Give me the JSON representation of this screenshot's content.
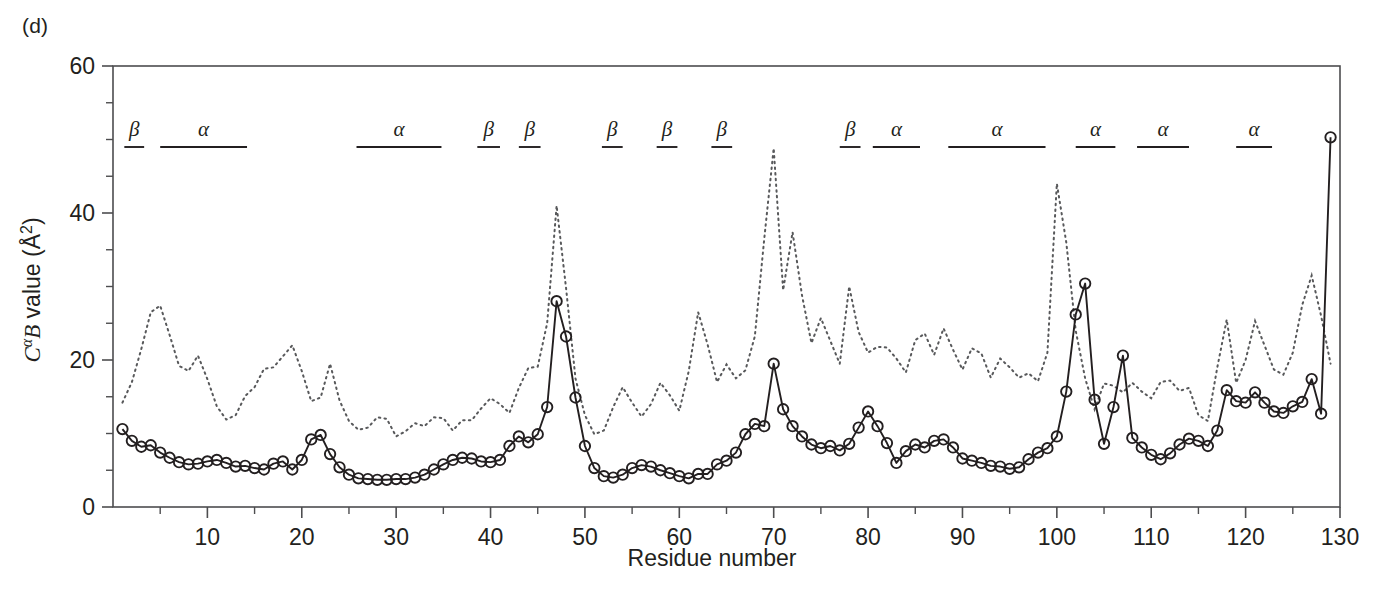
{
  "panel": {
    "label": "(d)"
  },
  "axes": {
    "y_title_parts": {
      "c": "C",
      "alpha": "α",
      "b": "B",
      "rest": " value (Å",
      "sup": "2",
      "close": ")"
    },
    "y_title_plain": "CαB value (Å2)",
    "x_title": "Residue number",
    "y_ticks_major": [
      0,
      20,
      40,
      60
    ],
    "y_ticks_minor": [
      5,
      10,
      15,
      25,
      30,
      35,
      45,
      50,
      55
    ],
    "x_ticks_major": [
      10,
      20,
      30,
      40,
      50,
      60,
      70,
      80,
      90,
      100,
      110,
      120,
      130
    ],
    "x_ticks_minor": [
      5,
      15,
      25,
      35,
      45,
      55,
      65,
      75,
      85,
      95,
      105,
      115,
      125
    ],
    "xlim": [
      0,
      130
    ],
    "ylim": [
      0,
      60
    ],
    "grid": false
  },
  "colors": {
    "axis": "#4d4d4f",
    "solid_series": "#231f20",
    "dotted_series": "#58595b",
    "text": "#231f20",
    "background": "#ffffff"
  },
  "secondary_structure": {
    "row_label": "secondary structure annotation",
    "elements": [
      {
        "type": "β",
        "start": 1.2,
        "end": 3.3
      },
      {
        "type": "α",
        "start": 5.0,
        "end": 14.2
      },
      {
        "type": "α",
        "start": 25.8,
        "end": 34.8
      },
      {
        "type": "β",
        "start": 38.6,
        "end": 41.0
      },
      {
        "type": "β",
        "start": 43.0,
        "end": 45.3
      },
      {
        "type": "β",
        "start": 51.8,
        "end": 54.0
      },
      {
        "type": "β",
        "start": 57.6,
        "end": 59.8
      },
      {
        "type": "β",
        "start": 63.4,
        "end": 65.6
      },
      {
        "type": "β",
        "start": 77.0,
        "end": 79.2
      },
      {
        "type": "α",
        "start": 80.5,
        "end": 85.5
      },
      {
        "type": "α",
        "start": 88.5,
        "end": 98.8
      },
      {
        "type": "α",
        "start": 102.0,
        "end": 106.2
      },
      {
        "type": "α",
        "start": 108.5,
        "end": 114.0
      },
      {
        "type": "α",
        "start": 119.0,
        "end": 122.8
      }
    ]
  },
  "chart_data": {
    "type": "line",
    "title": "",
    "xlabel": "Residue number",
    "ylabel": "CαB value (Å2)",
    "xlim": [
      0,
      130
    ],
    "ylim": [
      0,
      60
    ],
    "grid": false,
    "legend": "none",
    "x": [
      1,
      2,
      3,
      4,
      5,
      6,
      7,
      8,
      9,
      10,
      11,
      12,
      13,
      14,
      15,
      16,
      17,
      18,
      19,
      20,
      21,
      22,
      23,
      24,
      25,
      26,
      27,
      28,
      29,
      30,
      31,
      32,
      33,
      34,
      35,
      36,
      37,
      38,
      39,
      40,
      41,
      42,
      43,
      44,
      45,
      46,
      47,
      48,
      49,
      50,
      51,
      52,
      53,
      54,
      55,
      56,
      57,
      58,
      59,
      60,
      61,
      62,
      63,
      64,
      65,
      66,
      67,
      68,
      69,
      70,
      71,
      72,
      73,
      74,
      75,
      76,
      77,
      78,
      79,
      80,
      81,
      82,
      83,
      84,
      85,
      86,
      87,
      88,
      89,
      90,
      91,
      92,
      93,
      94,
      95,
      96,
      97,
      98,
      99,
      100,
      101,
      102,
      103,
      104,
      105,
      106,
      107,
      108,
      109,
      110,
      111,
      112,
      113,
      114,
      115,
      116,
      117,
      118,
      119,
      120,
      121,
      122,
      123,
      124,
      125,
      126,
      127,
      128,
      129
    ],
    "series": [
      {
        "name": "observed C-alpha B factors",
        "style": "solid-with-open-circle-markers",
        "values": [
          10.6,
          9.0,
          8.2,
          8.4,
          7.4,
          6.7,
          6.1,
          5.8,
          5.9,
          6.2,
          6.4,
          6.0,
          5.5,
          5.6,
          5.3,
          5.1,
          5.9,
          6.2,
          5.1,
          6.4,
          9.2,
          9.8,
          7.2,
          5.4,
          4.4,
          3.9,
          3.8,
          3.7,
          3.7,
          3.8,
          3.8,
          4.0,
          4.4,
          5.1,
          5.8,
          6.4,
          6.7,
          6.6,
          6.2,
          6.1,
          6.4,
          8.3,
          9.6,
          8.8,
          9.9,
          13.6,
          28.0,
          23.2,
          14.9,
          8.3,
          5.3,
          4.2,
          4.0,
          4.4,
          5.3,
          5.7,
          5.5,
          5.0,
          4.6,
          4.2,
          3.9,
          4.5,
          4.5,
          5.8,
          6.3,
          7.4,
          9.9,
          11.3,
          11.0,
          19.5,
          13.3,
          11.0,
          9.6,
          8.5,
          8.0,
          8.3,
          7.7,
          8.6,
          10.8,
          13.0,
          11.0,
          8.7,
          6.0,
          7.6,
          8.5,
          8.1,
          9.0,
          9.2,
          8.1,
          6.6,
          6.3,
          6.0,
          5.6,
          5.5,
          5.2,
          5.4,
          6.5,
          7.4,
          8.0,
          9.6,
          15.7,
          26.2,
          30.4,
          14.6,
          8.6,
          13.6,
          20.6,
          9.4,
          8.1,
          7.1,
          6.5,
          7.3,
          8.5,
          9.3,
          9.0,
          8.3,
          10.4,
          15.9,
          14.4,
          14.2,
          15.6,
          14.2,
          13.0,
          12.8,
          13.7,
          14.3,
          17.4,
          12.7,
          50.3
        ]
      },
      {
        "name": "reference C-alpha B factors",
        "style": "dotted",
        "values": [
          14.2,
          17.0,
          21.5,
          26.5,
          27.4,
          23.4,
          19.2,
          18.5,
          20.6,
          17.4,
          13.7,
          11.9,
          12.5,
          15.1,
          16.3,
          18.8,
          19.0,
          20.5,
          22.0,
          18.5,
          14.4,
          14.9,
          19.5,
          14.5,
          11.7,
          10.5,
          10.8,
          12.2,
          12.0,
          9.6,
          10.3,
          11.4,
          11.0,
          12.2,
          12.1,
          10.4,
          11.8,
          11.8,
          13.4,
          14.8,
          14.0,
          12.8,
          16.2,
          18.9,
          19.1,
          25.0,
          41.0,
          29.8,
          17.5,
          12.5,
          9.9,
          10.4,
          13.6,
          16.3,
          14.2,
          12.3,
          14.0,
          16.9,
          15.2,
          13.1,
          18.5,
          26.5,
          22.1,
          17.0,
          19.4,
          17.5,
          18.6,
          23.2,
          36.5,
          48.8,
          29.5,
          37.4,
          28.8,
          22.3,
          25.7,
          22.6,
          19.5,
          30.0,
          23.8,
          21.0,
          21.8,
          21.7,
          20.2,
          18.3,
          22.7,
          23.6,
          20.7,
          24.3,
          21.4,
          18.7,
          21.6,
          20.9,
          17.6,
          20.2,
          19.0,
          17.6,
          18.2,
          17.1,
          21.0,
          44.0,
          36.0,
          24.0,
          17.5,
          13.3,
          16.8,
          16.5,
          15.6,
          16.9,
          15.7,
          14.8,
          17.0,
          17.2,
          15.8,
          16.2,
          12.5,
          11.7,
          19.0,
          25.5,
          16.9,
          20.0,
          25.3,
          22.0,
          18.7,
          18.0,
          21.0,
          27.5,
          31.5,
          26.0,
          19.5
        ]
      }
    ],
    "annotations": {
      "peaks": [
        {
          "residue": 47,
          "solid": 28.0,
          "dotted": 41.0
        },
        {
          "residue": 70,
          "solid": 19.5,
          "dotted": 48.8
        },
        {
          "residue": 103,
          "solid": 30.4,
          "dotted": 44.0
        },
        {
          "residue": 107,
          "solid": 20.6
        },
        {
          "residue": 129,
          "solid": 50.3
        }
      ]
    }
  }
}
